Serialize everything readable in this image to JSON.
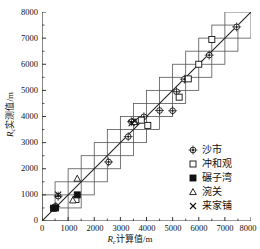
{
  "chart_data": {
    "type": "scatter",
    "title": "",
    "xlabel": "Rc计算值/m",
    "ylabel": "Rc实测值/m",
    "xlabel_parts": {
      "sym": "R",
      "sub": "c",
      "rest": "计算值/m"
    },
    "ylabel_parts": {
      "sym": "R",
      "sub": "c",
      "rest": "实测值/m"
    },
    "xlim": [
      0,
      8000
    ],
    "ylim": [
      0,
      8000
    ],
    "xticks": [
      0,
      1000,
      2000,
      3000,
      4000,
      5000,
      6000,
      7000,
      8000
    ],
    "yticks": [
      0,
      1000,
      2000,
      3000,
      4000,
      5000,
      6000,
      7000,
      8000
    ],
    "xticklabels": [
      "0",
      "1000",
      "2000",
      "3000",
      "4000",
      "5000",
      "6000",
      "7000",
      "8000"
    ],
    "yticklabels": [
      "0",
      "1000",
      "2000",
      "3000",
      "4000",
      "5000",
      "6000",
      "7000",
      "8000"
    ],
    "grid": false,
    "legend_position": "lower-right",
    "reference_line": {
      "name": "1:1 line",
      "from": [
        0,
        0
      ],
      "to": [
        8000,
        8000
      ]
    },
    "error_boxes": {
      "name": "tolerance boxes",
      "half_width": 500,
      "centers": [
        500,
        1000,
        1500,
        2000,
        2500,
        3000,
        3500,
        4000,
        4500,
        5000,
        5500,
        6000,
        6500,
        7000,
        7500
      ]
    },
    "series": [
      {
        "name": "沙市",
        "marker": "circle-dot",
        "points": [
          [
            470,
            520
          ],
          [
            530,
            560
          ],
          [
            620,
            950
          ],
          [
            2550,
            2260
          ],
          [
            3300,
            3230
          ],
          [
            3420,
            3800
          ],
          [
            3900,
            3990
          ],
          [
            4500,
            4230
          ],
          [
            5000,
            4220
          ],
          [
            5150,
            4950
          ],
          [
            5450,
            5430
          ],
          [
            6400,
            6350
          ],
          [
            7450,
            7430
          ]
        ]
      },
      {
        "name": "冲和观",
        "marker": "square-open",
        "points": [
          [
            1300,
            820
          ],
          [
            3800,
            3860
          ],
          [
            4050,
            3660
          ],
          [
            5250,
            4740
          ],
          [
            5600,
            5440
          ],
          [
            6000,
            6000
          ],
          [
            6500,
            6950
          ]
        ]
      },
      {
        "name": "碾子湾",
        "marker": "square-filled",
        "points": [
          [
            440,
            490
          ],
          [
            520,
            500
          ],
          [
            1350,
            1000
          ]
        ]
      },
      {
        "name": "涴关",
        "marker": "triangle-open",
        "points": [
          [
            1180,
            790
          ],
          [
            1350,
            1620
          ],
          [
            3560,
            3790
          ]
        ]
      },
      {
        "name": "来家铺",
        "marker": "cross",
        "points": [
          [
            620,
            1010
          ],
          [
            3430,
            3750
          ],
          [
            3550,
            3820
          ]
        ]
      }
    ]
  },
  "legend": {
    "items": [
      {
        "label": "沙市",
        "marker": "circle-dot"
      },
      {
        "label": "冲和观",
        "marker": "square-open"
      },
      {
        "label": "碾子湾",
        "marker": "square-filled"
      },
      {
        "label": "涴关",
        "marker": "triangle-open"
      },
      {
        "label": "来家铺",
        "marker": "cross"
      }
    ]
  },
  "colors": {
    "axis": "#333333",
    "box": "#555555",
    "line": "#222222",
    "marker": "#111111",
    "background": "#ffffff"
  }
}
